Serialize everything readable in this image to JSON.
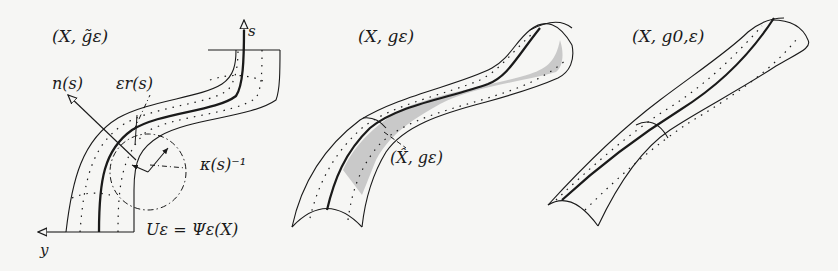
{
  "figure": {
    "panels": [
      {
        "id": "panel-1",
        "title": "(X, g̃ε)",
        "labels": {
          "normal": "n(s)",
          "radius": "εr(s)",
          "curvature": "κ(s)⁻¹",
          "tube": "Uε = Ψε(X)",
          "s_axis": "s",
          "y_axis": "y"
        }
      },
      {
        "id": "panel-2",
        "title": "(X, gε)",
        "labels": {
          "subregion": "(X̂, gε)"
        },
        "shaded_fill": "#c9c9c9"
      },
      {
        "id": "panel-3",
        "title": "(X, g0,ε)"
      }
    ],
    "colors": {
      "background": "#f6f6f4",
      "ink": "#1a1a1a",
      "shade": "#c9c9c9"
    }
  }
}
